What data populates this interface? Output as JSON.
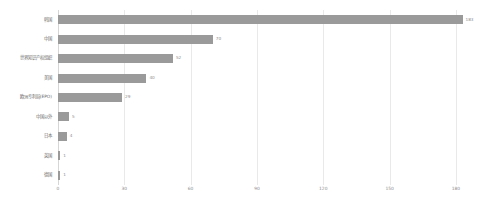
{
  "chart_data": {
    "type": "bar",
    "orientation": "horizontal",
    "title": "",
    "xlabel": "",
    "ylabel": "",
    "xlim": [
      0,
      190
    ],
    "ylim": [
      0,
      9
    ],
    "grid": true,
    "legend": false,
    "bar_color": "#9a9a9a",
    "grid_color": "#e9e9e9",
    "label_color": "#6b6b6b",
    "value_label_color": "#8c8c8c",
    "xticks": [
      0,
      30,
      60,
      90,
      120,
      150,
      180
    ],
    "xtick_labels": [
      "0",
      "30",
      "60",
      "90",
      "120",
      "150",
      "180"
    ],
    "categories": [
      "韩国",
      "中国",
      "世界知识产权组织",
      "美国",
      "欧洲专利局(EPO)",
      "中国以外",
      "日本",
      "英国",
      "德国"
    ],
    "values": [
      183,
      70,
      52,
      40,
      29,
      5,
      4,
      1,
      1
    ],
    "value_labels": [
      "183",
      "70",
      "52",
      "40",
      "29",
      "5",
      "4",
      "1",
      "1"
    ]
  }
}
